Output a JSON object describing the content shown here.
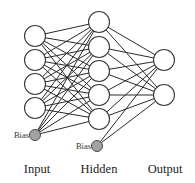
{
  "diagram": {
    "type": "feed-forward neural network",
    "layers": [
      {
        "id": "input",
        "label": "Input",
        "neurons": 4,
        "has_bias": true,
        "bias_label": "Bias"
      },
      {
        "id": "hidden",
        "label": "Hidden",
        "neurons": 5,
        "has_bias": true,
        "bias_label": "Bias"
      },
      {
        "id": "output",
        "label": "Output",
        "neurons": 2,
        "has_bias": false
      }
    ],
    "connectivity": "fully-connected",
    "colors": {
      "neuron_fill": "#ffffff",
      "bias_fill": "#a3a3a3",
      "edge": "#2a2a2a"
    }
  }
}
